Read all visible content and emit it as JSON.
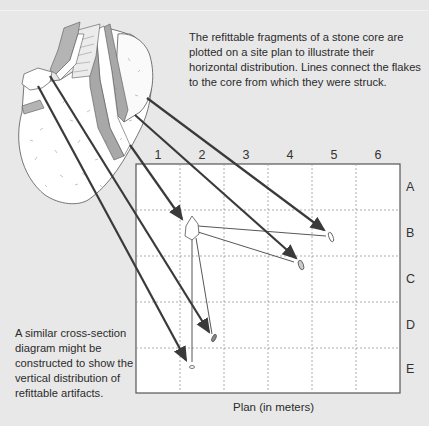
{
  "captions": {
    "top": "The refittable fragments of a stone core are plotted on a site plan to illustrate their horizontal distribution. Lines connect the flakes to the core from which they were struck.",
    "left": "A similar cross-section diagram might be constructed to show the vertical distribution of refittable artifacts."
  },
  "plan": {
    "label": "Plan (in meters)",
    "columns": [
      "1",
      "2",
      "3",
      "4",
      "5",
      "6"
    ],
    "rows": [
      "A",
      "B",
      "C",
      "D",
      "E"
    ]
  },
  "artifacts": [
    {
      "name": "core",
      "cell": "B2"
    },
    {
      "name": "flake-1",
      "cell": "B5"
    },
    {
      "name": "flake-2",
      "cell": "C4"
    },
    {
      "name": "flake-3",
      "cell": "D2"
    },
    {
      "name": "flake-4",
      "cell": "E2"
    }
  ],
  "colors": {
    "background": "#e8e8e8",
    "grid_border": "#555555",
    "grid_lines": "#9a9a9a",
    "arrow": "#3a3a3a",
    "core_fill": "#ffffff",
    "core_shade": "#a8a8a8"
  }
}
